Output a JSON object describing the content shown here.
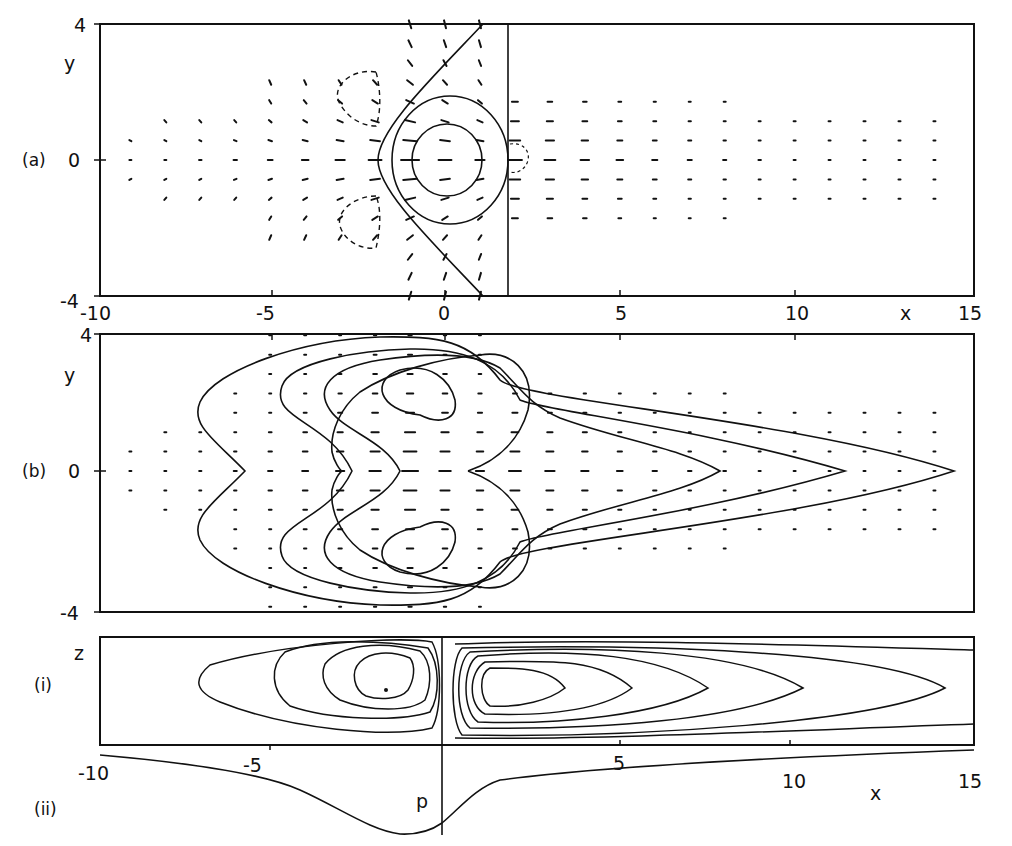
{
  "figure": {
    "ink_color": "#111111",
    "background": "#ffffff",
    "panels": [
      {
        "id": "a",
        "label": "(a)",
        "ylabel": "y",
        "yticks": [
          "4",
          "0",
          "-4"
        ],
        "xticks": [
          "-10",
          "-5",
          "0",
          "5",
          "10",
          "15"
        ],
        "xlabel": "x"
      },
      {
        "id": "b",
        "label": "(b)",
        "ylabel": "y",
        "yticks": [
          "4",
          "0",
          "-4"
        ]
      },
      {
        "id": "i",
        "label": "(i)",
        "ylabel": "z"
      },
      {
        "id": "ii",
        "label": "(ii)",
        "ylabel": "p",
        "xticks": [
          "-10",
          "-5",
          "5",
          "10",
          "15"
        ],
        "xlabel": "x"
      }
    ]
  },
  "chart_data": [
    {
      "type": "vector-field+contour",
      "panel": "(a)",
      "xlabel": "x",
      "ylabel": "y",
      "xlim": [
        -10,
        15
      ],
      "ylim": [
        -4,
        4
      ],
      "xticks": [
        -10,
        -5,
        0,
        5,
        10,
        15
      ],
      "yticks": [
        -4,
        0,
        4
      ],
      "annotations": [
        "solid parabola-like front passing through (-2,0) reaching x≈0 at y=±4",
        "vertical solid line at x≈1.8",
        "closed solid contours centred near (0,0), radii ≈1.5 and ≈2.5",
        "dashed closed contours near (-3,±2.3)",
        "small dashed contour near (2.2,0)"
      ],
      "vectors": "flow converges toward x≈0 from the left (arrows pointing +x), weak leftward arrows for x>2"
    },
    {
      "type": "vector-field+contour",
      "panel": "(b)",
      "xlabel": "x",
      "ylabel": "y",
      "xlim": [
        -10,
        15
      ],
      "ylim": [
        -4,
        4
      ],
      "yticks": [
        -4,
        0,
        4
      ],
      "annotations": [
        "two vortex centres near (-1,±1.8)",
        "nested contours extending downstream to x≈14 at y=0"
      ]
    },
    {
      "type": "streamlines",
      "panel": "(i)",
      "xlabel": "x",
      "ylabel": "z",
      "xlim": [
        -10,
        15
      ],
      "annotations": [
        "cell centred near x≈-1.8 (left of x=0)",
        "elongated cell centred near x≈2.5 extending to x≈14"
      ]
    },
    {
      "type": "line",
      "panel": "(ii)",
      "xlabel": "x",
      "ylabel": "p",
      "xlim": [
        -10,
        15
      ],
      "xticks": [
        -10,
        -5,
        5,
        10,
        15
      ],
      "x": [
        -10,
        -8,
        -6,
        -5,
        -4,
        -3,
        -2,
        -1.5,
        -1,
        -0.5,
        0,
        0.5,
        1,
        2,
        4,
        6,
        8,
        10,
        12,
        15
      ],
      "values": [
        0.0,
        -0.08,
        -0.18,
        -0.26,
        -0.38,
        -0.55,
        -0.78,
        -0.9,
        -0.97,
        -0.96,
        -0.88,
        -0.72,
        -0.52,
        -0.3,
        -0.2,
        -0.15,
        -0.11,
        -0.08,
        -0.05,
        -0.02
      ],
      "annotations": [
        "minimum near x≈-1"
      ]
    }
  ]
}
